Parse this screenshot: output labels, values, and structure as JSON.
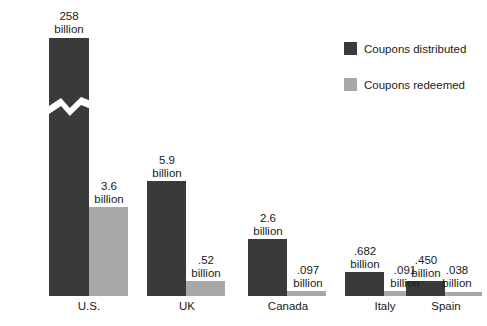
{
  "legend": {
    "position": "top-right",
    "entries": [
      {
        "label": "Coupons distributed",
        "color": "#3a3a3a",
        "swatch_name": "legend-swatch-distributed"
      },
      {
        "label": "Coupons redeemed",
        "color": "#a8a8a8",
        "swatch_name": "legend-swatch-redeemed"
      }
    ]
  },
  "colors": {
    "distributed": "#3a3a3a",
    "redeemed": "#a8a8a8",
    "background": "#ffffff",
    "text": "#1a1a1a"
  },
  "axis": {
    "baseline_y": 296,
    "has_axis_line": false,
    "has_gridlines": false,
    "has_y_axis_ticks": false,
    "broken_axis_note": "U.S. distributed bar is drawn with a zigzag break because 258 is off-scale"
  },
  "chart_data": {
    "type": "bar",
    "title": "",
    "subtitle": "",
    "xlabel": "",
    "ylabel": "",
    "grid": false,
    "legend_position": "top-right",
    "categories": [
      "U.S.",
      "UK",
      "Canada",
      "Italy",
      "Spain"
    ],
    "unit": "billion",
    "series": [
      {
        "name": "Coupons distributed",
        "color": "#3a3a3a",
        "values": [
          258,
          5.9,
          2.6,
          0.682,
          0.45
        ],
        "value_labels": [
          "258",
          "5.9",
          "2.6",
          ".682",
          ".450"
        ],
        "unit_labels": [
          "billion",
          "billion",
          "billion",
          "billion",
          "billion"
        ]
      },
      {
        "name": "Coupons redeemed",
        "color": "#a8a8a8",
        "values": [
          3.6,
          0.52,
          0.097,
          0.091,
          0.038
        ],
        "value_labels": [
          "3.6",
          ".52",
          ".097",
          ".091",
          ".038"
        ],
        "unit_labels": [
          "billion",
          "billion",
          "billion",
          "billion",
          "billion"
        ]
      }
    ]
  },
  "bars": [
    {
      "name": "bar-us-distributed",
      "series": "distributed",
      "category": "U.S.",
      "left": 49,
      "top": 38,
      "width": 40,
      "height": 258,
      "broken": true
    },
    {
      "name": "bar-us-redeemed",
      "series": "redeemed",
      "category": "U.S.",
      "left": 89,
      "top": 207,
      "width": 39,
      "height": 89,
      "broken": false
    },
    {
      "name": "bar-uk-distributed",
      "series": "distributed",
      "category": "UK",
      "left": 147,
      "top": 181,
      "width": 39,
      "height": 115,
      "broken": false
    },
    {
      "name": "bar-uk-redeemed",
      "series": "redeemed",
      "category": "UK",
      "left": 186,
      "top": 281,
      "width": 39,
      "height": 15,
      "broken": false
    },
    {
      "name": "bar-canada-distributed",
      "series": "distributed",
      "category": "Canada",
      "left": 248,
      "top": 239,
      "width": 39,
      "height": 57,
      "broken": false
    },
    {
      "name": "bar-canada-redeemed",
      "series": "redeemed",
      "category": "Canada",
      "left": 287,
      "top": 291,
      "width": 39,
      "height": 5,
      "broken": false
    },
    {
      "name": "bar-italy-distributed",
      "series": "distributed",
      "category": "Italy",
      "left": 345,
      "top": 272,
      "width": 39,
      "height": 24,
      "broken": false
    },
    {
      "name": "bar-italy-redeemed",
      "series": "redeemed",
      "category": "Italy",
      "left": 384,
      "top": 291,
      "width": 39,
      "height": 5,
      "broken": false
    },
    {
      "name": "bar-spain-distributed",
      "series": "distributed",
      "category": "Spain",
      "left": 406,
      "top": 281,
      "width": 39,
      "height": 15,
      "broken": false
    },
    {
      "name": "bar-spain-redeemed",
      "series": "redeemed",
      "category": "Spain",
      "left": 445,
      "top": 292,
      "width": 37,
      "height": 4,
      "broken": false
    }
  ],
  "value_label_layout": [
    {
      "name": "value-label-us-distributed",
      "left": 39,
      "top": 10,
      "width": 60,
      "value_path": "chart_data.series.0.value_labels.0",
      "unit_path": "chart_data.series.0.unit_labels.0"
    },
    {
      "name": "value-label-us-redeemed",
      "left": 79,
      "top": 180,
      "width": 60,
      "value_path": "chart_data.series.1.value_labels.0",
      "unit_path": "chart_data.series.1.unit_labels.0"
    },
    {
      "name": "value-label-uk-distributed",
      "left": 137,
      "top": 154,
      "width": 60,
      "value_path": "chart_data.series.0.value_labels.1",
      "unit_path": "chart_data.series.0.unit_labels.1"
    },
    {
      "name": "value-label-uk-redeemed",
      "left": 176,
      "top": 254,
      "width": 60,
      "value_path": "chart_data.series.1.value_labels.1",
      "unit_path": "chart_data.series.1.unit_labels.1"
    },
    {
      "name": "value-label-canada-distributed",
      "left": 238,
      "top": 212,
      "width": 60,
      "value_path": "chart_data.series.0.value_labels.2",
      "unit_path": "chart_data.series.0.unit_labels.2"
    },
    {
      "name": "value-label-canada-redeemed",
      "left": 278,
      "top": 264,
      "width": 60,
      "value_path": "chart_data.series.1.value_labels.2",
      "unit_path": "chart_data.series.1.unit_labels.2"
    },
    {
      "name": "value-label-italy-distributed",
      "left": 335,
      "top": 245,
      "width": 60,
      "value_path": "chart_data.series.0.value_labels.3",
      "unit_path": "chart_data.series.0.unit_labels.3"
    },
    {
      "name": "value-label-italy-redeemed",
      "left": 375,
      "top": 264,
      "width": 60,
      "value_path": "chart_data.series.1.value_labels.3",
      "unit_path": "chart_data.series.1.unit_labels.3"
    },
    {
      "name": "value-label-spain-distributed",
      "left": 396,
      "top": 254,
      "width": 60,
      "value_path": "chart_data.series.0.value_labels.4",
      "unit_path": "chart_data.series.0.unit_labels.4"
    },
    {
      "name": "value-label-spain-redeemed",
      "left": 427,
      "top": 264,
      "width": 60,
      "value_path": "chart_data.series.1.value_labels.4",
      "unit_path": "chart_data.series.1.unit_labels.4"
    }
  ],
  "category_label_layout": [
    {
      "name": "category-label-us",
      "left": 59,
      "width": 60,
      "path": "chart_data.categories.0"
    },
    {
      "name": "category-label-uk",
      "left": 157,
      "width": 60,
      "path": "chart_data.categories.1"
    },
    {
      "name": "category-label-canada",
      "left": 258,
      "width": 60,
      "path": "chart_data.categories.2"
    },
    {
      "name": "category-label-italy",
      "left": 355,
      "width": 60,
      "path": "chart_data.categories.3"
    },
    {
      "name": "category-label-spain",
      "left": 416,
      "width": 60,
      "path": "chart_data.categories.4"
    }
  ]
}
